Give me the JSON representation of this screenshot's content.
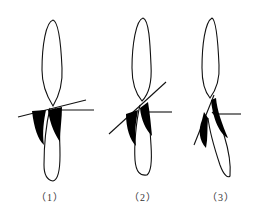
{
  "figure": {
    "panels": [
      {
        "id": 1,
        "label": "（1）",
        "line_angle": "slight incline",
        "description": "Two leaf-shaped outlines crossing, with black shaded regions below a crossing line"
      },
      {
        "id": 2,
        "label": "（2）",
        "line_angle": "moderate incline",
        "description": "Two leaf-shaped outlines crossing, with steeper crossing line"
      },
      {
        "id": 3,
        "label": "（3）",
        "line_angle": "steep incline",
        "description": "Two leaf-shaped outlines crossing, with steepest crossing line"
      }
    ],
    "colors": {
      "stroke": "#111111",
      "fill": "#000000",
      "background": "#ffffff"
    }
  }
}
